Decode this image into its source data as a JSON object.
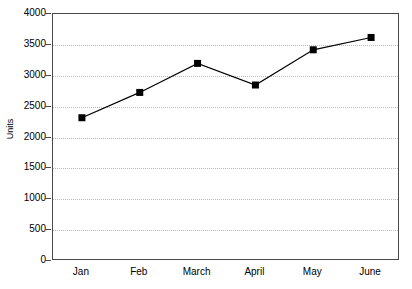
{
  "chart_data": {
    "type": "line",
    "title": "",
    "subtitle": "",
    "xlabel": "",
    "ylabel": "Units",
    "categories": [
      "Jan",
      "Feb",
      "March",
      "April",
      "May",
      "June"
    ],
    "values": [
      2320,
      2730,
      3200,
      2850,
      3420,
      3620
    ],
    "series": [
      {
        "name": "Units",
        "values": [
          2320,
          2730,
          3200,
          2850,
          3420,
          3620
        ]
      }
    ],
    "ylim": [
      0,
      4000
    ],
    "yticks": [
      0,
      500,
      1000,
      1500,
      2000,
      2500,
      3000,
      3500,
      4000
    ],
    "ytick_labels": [
      "0",
      "500",
      "1000",
      "1500",
      "2000",
      "2500",
      "3000",
      "3500",
      "4000"
    ],
    "xtick_labels": [
      "Jan",
      "Feb",
      "March",
      "April",
      "May",
      "June"
    ],
    "grid": "horizontal-dotted",
    "legend": "none",
    "marker": "filled-square",
    "line_color": "#000000",
    "marker_color": "#000000",
    "grid_color": "#b9b9b9",
    "axis_color": "#4a4a4a",
    "background": "#ffffff"
  },
  "axes": {
    "y_title": "Units"
  }
}
